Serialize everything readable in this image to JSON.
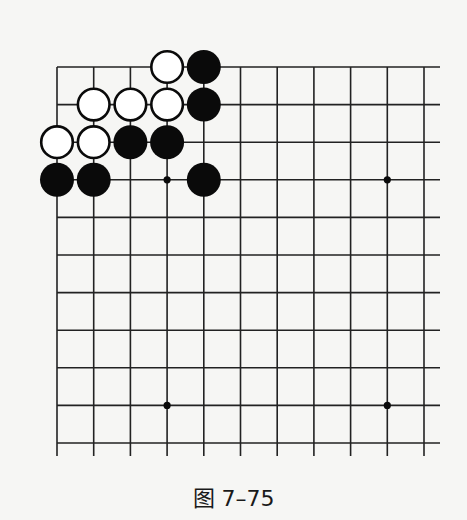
{
  "diagram": {
    "type": "go-board-fragment",
    "caption": "图 7–75",
    "grid": {
      "x": [
        57,
        93.7,
        130.4,
        167.1,
        203.8,
        240.5,
        277.2,
        313.9,
        350.6,
        387.3,
        424
      ],
      "y": [
        67,
        104.6,
        142.2,
        179.8,
        217.4,
        255,
        292.6,
        330.2,
        367.8,
        405.4,
        443
      ],
      "h_line_right": 440,
      "v_line_bottom": 456
    },
    "colors": {
      "line": "#222222",
      "black": "#0a0a0a",
      "white": "#ffffff",
      "background": "#f6f6f4"
    },
    "star_points": [
      [
        3,
        3
      ],
      [
        9,
        3
      ],
      [
        3,
        9
      ],
      [
        9,
        9
      ]
    ],
    "stones": [
      {
        "color": "white",
        "col": 3,
        "row": 0
      },
      {
        "color": "black",
        "col": 4,
        "row": 0
      },
      {
        "color": "white",
        "col": 1,
        "row": 1
      },
      {
        "color": "white",
        "col": 2,
        "row": 1
      },
      {
        "color": "white",
        "col": 3,
        "row": 1
      },
      {
        "color": "black",
        "col": 4,
        "row": 1
      },
      {
        "color": "white",
        "col": 0,
        "row": 2
      },
      {
        "color": "white",
        "col": 1,
        "row": 2
      },
      {
        "color": "black",
        "col": 2,
        "row": 2
      },
      {
        "color": "black",
        "col": 3,
        "row": 2
      },
      {
        "color": "black",
        "col": 0,
        "row": 3
      },
      {
        "color": "black",
        "col": 1,
        "row": 3
      },
      {
        "color": "black",
        "col": 4,
        "row": 3
      }
    ]
  }
}
